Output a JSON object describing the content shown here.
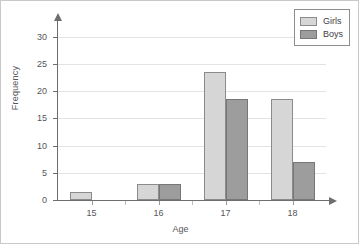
{
  "chart_data": {
    "type": "bar",
    "title": "",
    "subtitle": "",
    "xlabel": "Age",
    "ylabel": "Frequency",
    "categories": [
      "15",
      "16",
      "17",
      "18"
    ],
    "series": [
      {
        "name": "Girls",
        "color": "#d6d6d6",
        "values": [
          1.5,
          3,
          23.5,
          18.6
        ]
      },
      {
        "name": "Boys",
        "color": "#9d9d9d",
        "values": [
          0,
          3,
          18.6,
          7
        ]
      }
    ],
    "ylim": [
      0,
      32
    ],
    "yticks": [
      0,
      5,
      10,
      15,
      20,
      25,
      30
    ],
    "ytick_labels": [
      "0",
      "5",
      "10",
      "15",
      "20",
      "25",
      "30"
    ],
    "xtick_labels": [
      "15",
      "16",
      "17",
      "18"
    ],
    "grid": "horizontal",
    "legend_position": "top-right",
    "axis_arrows": true,
    "annotations": []
  },
  "legend": {
    "entries": [
      {
        "label": "Girls"
      },
      {
        "label": "Boys"
      }
    ]
  }
}
